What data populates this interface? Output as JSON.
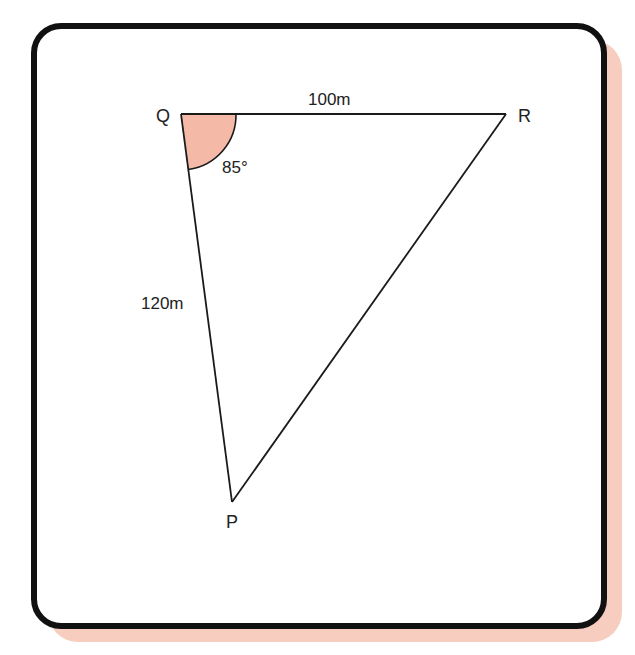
{
  "figure": {
    "type": "triangle",
    "vertices": [
      {
        "name": "Q",
        "label": "Q"
      },
      {
        "name": "R",
        "label": "R"
      },
      {
        "name": "P",
        "label": "P"
      }
    ],
    "sides": [
      {
        "between": "QR",
        "label": "100m"
      },
      {
        "between": "QP",
        "label": "120m"
      }
    ],
    "angles": [
      {
        "at": "Q",
        "label": "85°"
      }
    ],
    "colors": {
      "angle_fill": "#f4b9a7",
      "shadow": "#f6cdbf",
      "border": "#111111",
      "lines": "#1a1a1a"
    }
  }
}
